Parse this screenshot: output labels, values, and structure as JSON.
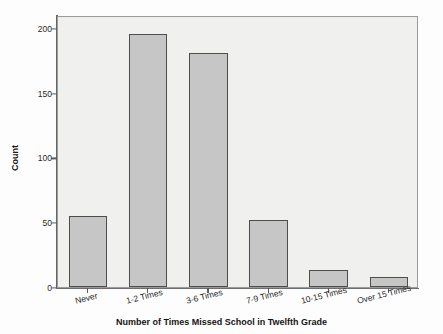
{
  "chart_data": {
    "type": "bar",
    "title": "",
    "xlabel": "Number of Times Missed School in Twelfth Grade",
    "ylabel": "Count",
    "categories": [
      "Never",
      "1-2 Times",
      "3-6 Times",
      "7-9 Times",
      "10-15 Times",
      "Over 15 Times"
    ],
    "values": [
      55,
      195,
      181,
      52,
      13,
      8
    ],
    "ylim": [
      0,
      210
    ],
    "yticks": [
      0,
      50,
      100,
      150,
      200
    ],
    "ytick_labels": [
      "0",
      "50",
      "100",
      "150",
      "200"
    ],
    "grid": false,
    "legend": null,
    "colors": {
      "bar_fill": "#c6c6c6",
      "bar_edge": "#4d4d4d",
      "plot_background": "#f0f0ef",
      "axis": "#666666",
      "text": "#1a1a1a"
    }
  }
}
